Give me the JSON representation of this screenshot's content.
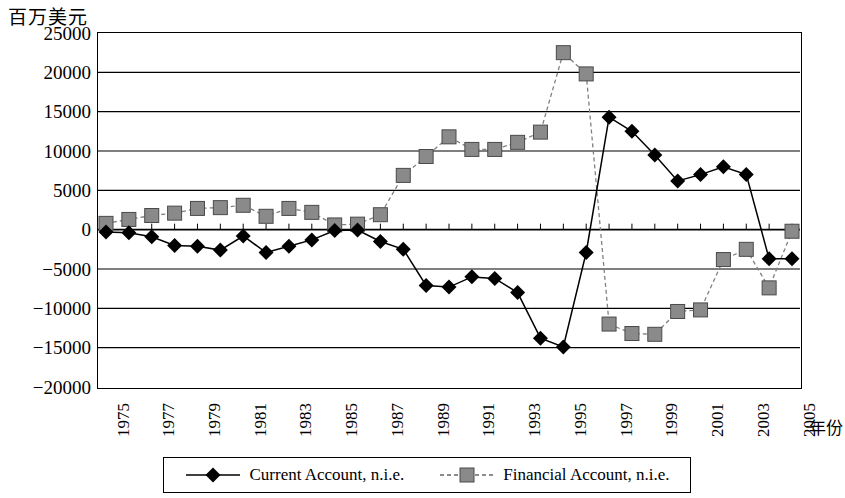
{
  "chart_data": {
    "type": "line",
    "title": "",
    "ylabel": "百万美元",
    "xlabel": "年份",
    "ylim": [
      -20000,
      25000
    ],
    "ytick_step": 5000,
    "yticks": [
      "25000",
      "20000",
      "15000",
      "10000",
      "5000",
      "0",
      "-5000",
      "-10000",
      "-15000",
      "-20000"
    ],
    "grid": "horizontal",
    "legend_position": "bottom",
    "xlim": [
      1975,
      2005
    ],
    "x": [
      1975,
      1976,
      1977,
      1978,
      1979,
      1980,
      1981,
      1982,
      1983,
      1984,
      1985,
      1986,
      1987,
      1988,
      1989,
      1990,
      1991,
      1992,
      1993,
      1994,
      1995,
      1996,
      1997,
      1998,
      1999,
      2000,
      2001,
      2002,
      2003,
      2004,
      2005
    ],
    "xtick_labels": [
      "1975",
      "1977",
      "1979",
      "1981",
      "1983",
      "1985",
      "1987",
      "1989",
      "1991",
      "1993",
      "1995",
      "1997",
      "1999",
      "2001",
      "2003",
      "2005"
    ],
    "series": [
      {
        "name": "Current Account, n.i.e.",
        "marker": "diamond",
        "marker_color": "#000000",
        "line_style": "solid",
        "line_color": "#000000",
        "values": [
          -300,
          -400,
          -900,
          -2000,
          -2100,
          -2600,
          -800,
          -2900,
          -2100,
          -1300,
          -100,
          -50,
          -1500,
          -2500,
          -7100,
          -7300,
          -6000,
          -6200,
          -8000,
          -13800,
          -14900,
          -2900,
          14300,
          12500,
          9500,
          6200,
          7000,
          8000,
          7000,
          -3700,
          -3700
        ]
      },
      {
        "name": "Financial Account, n.i.e.",
        "marker": "square",
        "marker_color": "#808080",
        "line_style": "dashed",
        "line_color": "#808080",
        "values": [
          800,
          1300,
          1800,
          2100,
          2700,
          2800,
          3100,
          1700,
          2700,
          2200,
          600,
          700,
          1900,
          6900,
          9300,
          11800,
          10200,
          10200,
          11100,
          12400,
          22500,
          19800,
          -12000,
          -13200,
          -13300,
          -10400,
          -10200,
          -3800,
          -2500,
          -7400,
          -200
        ]
      }
    ],
    "series_notes": {
      "current_account_2005": -3700,
      "financial_account_2005": 8000
    }
  },
  "legend": {
    "items": [
      {
        "label": "Current Account, n.i.e."
      },
      {
        "label": "Financial Account, n.i.e."
      }
    ]
  }
}
